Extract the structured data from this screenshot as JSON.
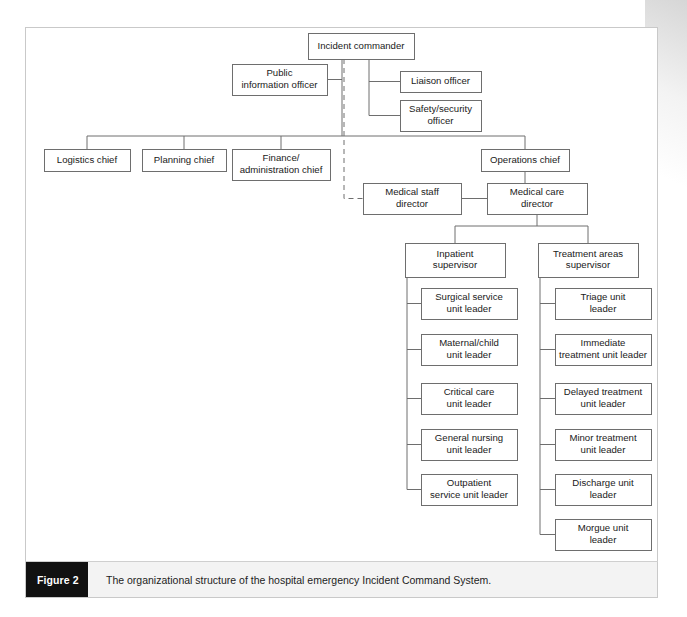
{
  "figure": {
    "label": "Figure 2",
    "caption": "The organizational structure of the hospital emergency Incident Command System.",
    "frame_border_color": "#c9c9c9",
    "caption_tab_color": "#111111",
    "caption_bg_color": "#f3f3f3"
  },
  "chart_data": {
    "type": "diagram",
    "diagram_kind": "organizational-chart",
    "title": "The organizational structure of the hospital emergency Incident Command System.",
    "box_stroke_color": "#6e6e6e",
    "box_fill_color": "#ffffff",
    "link_color": "#6e6e6e",
    "nodes": [
      {
        "id": "incident_commander",
        "label": "Incident commander",
        "lines": [
          "Incident commander"
        ],
        "x": 308,
        "y": 33,
        "w": 106,
        "h": 26,
        "level": 0
      },
      {
        "id": "public_information_officer",
        "label": "Public information officer",
        "lines": [
          "Public",
          "information officer"
        ],
        "x": 232,
        "y": 64,
        "w": 95,
        "h": 31,
        "level": 1
      },
      {
        "id": "liaison_officer",
        "label": "Liaison officer",
        "lines": [
          "Liaison officer"
        ],
        "x": 400,
        "y": 71,
        "w": 81,
        "h": 21,
        "level": 1
      },
      {
        "id": "safety_security_officer",
        "label": "Safety/security officer",
        "lines": [
          "Safety/security",
          "officer"
        ],
        "x": 400,
        "y": 100,
        "w": 81,
        "h": 31,
        "level": 1
      },
      {
        "id": "logistics_chief",
        "label": "Logistics chief",
        "lines": [
          "Logistics chief"
        ],
        "x": 44,
        "y": 149,
        "w": 86,
        "h": 22,
        "level": 2
      },
      {
        "id": "planning_chief",
        "label": "Planning chief",
        "lines": [
          "Planning chief"
        ],
        "x": 142,
        "y": 149,
        "w": 84,
        "h": 22,
        "level": 2
      },
      {
        "id": "finance_administration_chief",
        "label": "Finance/administration chief",
        "lines": [
          "Finance/",
          "administration chief"
        ],
        "x": 232,
        "y": 149,
        "w": 98,
        "h": 31,
        "level": 2
      },
      {
        "id": "operations_chief",
        "label": "Operations chief",
        "lines": [
          "Operations chief"
        ],
        "x": 481,
        "y": 149,
        "w": 88,
        "h": 22,
        "level": 2
      },
      {
        "id": "medical_staff_director",
        "label": "Medical staff director",
        "lines": [
          "Medical staff",
          "director"
        ],
        "x": 363,
        "y": 183,
        "w": 98,
        "h": 31,
        "level": 3
      },
      {
        "id": "medical_care_director",
        "label": "Medical care director",
        "lines": [
          "Medical care",
          "director"
        ],
        "x": 487,
        "y": 183,
        "w": 100,
        "h": 31,
        "level": 3
      },
      {
        "id": "inpatient_supervisor",
        "label": "Inpatient supervisor",
        "lines": [
          "Inpatient",
          "supervisor"
        ],
        "x": 405,
        "y": 243,
        "w": 100,
        "h": 34,
        "level": 4
      },
      {
        "id": "treatment_areas_supervisor",
        "label": "Treatment areas supervisor",
        "lines": [
          "Treatment areas",
          "supervisor"
        ],
        "x": 538,
        "y": 243,
        "w": 100,
        "h": 34,
        "level": 4
      },
      {
        "id": "surgical_service_unit_leader",
        "label": "Surgical service unit leader",
        "lines": [
          "Surgical service",
          "unit leader"
        ],
        "x": 421,
        "y": 288,
        "w": 96,
        "h": 31,
        "level": 5
      },
      {
        "id": "maternal_child_unit_leader",
        "label": "Maternal/child unit leader",
        "lines": [
          "Maternal/child",
          "unit leader"
        ],
        "x": 421,
        "y": 334,
        "w": 96,
        "h": 31,
        "level": 5
      },
      {
        "id": "critical_care_unit_leader",
        "label": "Critical care unit leader",
        "lines": [
          "Critical care",
          "unit leader"
        ],
        "x": 421,
        "y": 383,
        "w": 96,
        "h": 31,
        "level": 5
      },
      {
        "id": "general_nursing_unit_leader",
        "label": "General nursing unit leader",
        "lines": [
          "General nursing",
          "unit leader"
        ],
        "x": 421,
        "y": 429,
        "w": 96,
        "h": 31,
        "level": 5
      },
      {
        "id": "outpatient_service_unit_leader",
        "label": "Outpatient service unit leader",
        "lines": [
          "Outpatient",
          "service unit leader"
        ],
        "x": 421,
        "y": 474,
        "w": 96,
        "h": 31,
        "level": 5
      },
      {
        "id": "triage_unit_leader",
        "label": "Triage unit leader",
        "lines": [
          "Triage unit",
          "leader"
        ],
        "x": 555,
        "y": 288,
        "w": 96,
        "h": 31,
        "level": 5
      },
      {
        "id": "immediate_treatment_unit_leader",
        "label": "Immediate treatment unit leader",
        "lines": [
          "Immediate",
          "treatment unit leader"
        ],
        "x": 555,
        "y": 334,
        "w": 96,
        "h": 31,
        "level": 5
      },
      {
        "id": "delayed_treatment_unit_leader",
        "label": "Delayed treatment unit leader",
        "lines": [
          "Delayed treatment",
          "unit leader"
        ],
        "x": 555,
        "y": 383,
        "w": 96,
        "h": 31,
        "level": 5
      },
      {
        "id": "minor_treatment_unit_leader",
        "label": "Minor treatment unit leader",
        "lines": [
          "Minor treatment",
          "unit leader"
        ],
        "x": 555,
        "y": 429,
        "w": 96,
        "h": 31,
        "level": 5
      },
      {
        "id": "discharge_unit_leader",
        "label": "Discharge unit leader",
        "lines": [
          "Discharge unit",
          "leader"
        ],
        "x": 555,
        "y": 474,
        "w": 96,
        "h": 31,
        "level": 5
      },
      {
        "id": "morgue_unit_leader",
        "label": "Morgue unit leader",
        "lines": [
          "Morgue unit",
          "leader"
        ],
        "x": 555,
        "y": 519,
        "w": 96,
        "h": 31,
        "level": 5
      }
    ],
    "edges": [
      {
        "from": "incident_commander",
        "to": "public_information_officer",
        "style": "solid"
      },
      {
        "from": "incident_commander",
        "to": "liaison_officer",
        "style": "solid"
      },
      {
        "from": "incident_commander",
        "to": "safety_security_officer",
        "style": "solid"
      },
      {
        "from": "incident_commander",
        "to": "logistics_chief",
        "style": "solid"
      },
      {
        "from": "incident_commander",
        "to": "planning_chief",
        "style": "solid"
      },
      {
        "from": "incident_commander",
        "to": "finance_administration_chief",
        "style": "solid"
      },
      {
        "from": "incident_commander",
        "to": "operations_chief",
        "style": "solid"
      },
      {
        "from": "incident_commander",
        "to": "medical_staff_director",
        "style": "dashed"
      },
      {
        "from": "operations_chief",
        "to": "medical_care_director",
        "style": "solid"
      },
      {
        "from": "medical_staff_director",
        "to": "medical_care_director",
        "style": "solid"
      },
      {
        "from": "medical_care_director",
        "to": "inpatient_supervisor",
        "style": "solid"
      },
      {
        "from": "medical_care_director",
        "to": "treatment_areas_supervisor",
        "style": "solid"
      },
      {
        "from": "inpatient_supervisor",
        "to": "surgical_service_unit_leader",
        "style": "solid"
      },
      {
        "from": "inpatient_supervisor",
        "to": "maternal_child_unit_leader",
        "style": "solid"
      },
      {
        "from": "inpatient_supervisor",
        "to": "critical_care_unit_leader",
        "style": "solid"
      },
      {
        "from": "inpatient_supervisor",
        "to": "general_nursing_unit_leader",
        "style": "solid"
      },
      {
        "from": "inpatient_supervisor",
        "to": "outpatient_service_unit_leader",
        "style": "solid"
      },
      {
        "from": "treatment_areas_supervisor",
        "to": "triage_unit_leader",
        "style": "solid"
      },
      {
        "from": "treatment_areas_supervisor",
        "to": "immediate_treatment_unit_leader",
        "style": "solid"
      },
      {
        "from": "treatment_areas_supervisor",
        "to": "delayed_treatment_unit_leader",
        "style": "solid"
      },
      {
        "from": "treatment_areas_supervisor",
        "to": "minor_treatment_unit_leader",
        "style": "solid"
      },
      {
        "from": "treatment_areas_supervisor",
        "to": "discharge_unit_leader",
        "style": "solid"
      },
      {
        "from": "treatment_areas_supervisor",
        "to": "morgue_unit_leader",
        "style": "solid"
      }
    ]
  }
}
